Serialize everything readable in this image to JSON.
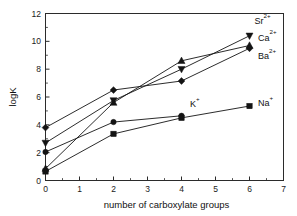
{
  "chart_data": {
    "type": "line",
    "title": "",
    "subtitle": "",
    "xlabel": "number of carboxylate groups",
    "ylabel": "logK",
    "xlim": [
      0,
      7
    ],
    "ylim": [
      0,
      12
    ],
    "x_ticks": [
      "0",
      "1",
      "2",
      "3",
      "4",
      "5",
      "6",
      "7"
    ],
    "x_tick_values": [
      0,
      1,
      2,
      3,
      4,
      5,
      6,
      7
    ],
    "y_ticks": [
      "0",
      "2",
      "4",
      "6",
      "8",
      "10",
      "12"
    ],
    "y_tick_values": [
      0,
      2,
      4,
      6,
      8,
      10,
      12
    ],
    "grid": false,
    "legend_position": "inline-right-labels",
    "series": [
      {
        "name": "Sr2+",
        "label": "Sr",
        "label_sup": "2+",
        "marker": "triangle-down",
        "color": "#141414",
        "x": [
          0,
          2,
          4,
          6
        ],
        "values": [
          2.7,
          5.75,
          8.0,
          10.4
        ]
      },
      {
        "name": "Ca2+",
        "label": "Ca",
        "label_sup": "2+",
        "marker": "triangle-up",
        "color": "#141414",
        "x": [
          0,
          2,
          4,
          6
        ],
        "values": [
          0.85,
          5.6,
          8.6,
          9.7
        ]
      },
      {
        "name": "Ba2+",
        "label": "Ba",
        "label_sup": "2+",
        "marker": "diamond",
        "color": "#141414",
        "x": [
          0,
          2,
          4,
          6
        ],
        "values": [
          3.8,
          6.5,
          7.15,
          9.5
        ]
      },
      {
        "name": "K+",
        "label": "K",
        "label_sup": "+",
        "marker": "circle",
        "color": "#141414",
        "x": [
          0,
          2,
          4
        ],
        "values": [
          2.05,
          4.2,
          4.65
        ]
      },
      {
        "name": "Na+",
        "label": "Na",
        "label_sup": "+",
        "marker": "square",
        "color": "#141414",
        "x": [
          0,
          2,
          4,
          6
        ],
        "values": [
          0.65,
          3.35,
          4.5,
          5.35
        ]
      }
    ],
    "annotations": [
      {
        "text": "Sr",
        "sup": "2+",
        "x": 6.15,
        "y": 11.25
      },
      {
        "text": "Ca",
        "sup": "2+",
        "x": 6.25,
        "y": 10.05
      },
      {
        "text": "Ba",
        "sup": "2+",
        "x": 6.25,
        "y": 8.75
      },
      {
        "text": "K",
        "sup": "+",
        "x": 4.25,
        "y": 5.3
      },
      {
        "text": "Na",
        "sup": "+",
        "x": 6.25,
        "y": 5.35
      }
    ]
  }
}
